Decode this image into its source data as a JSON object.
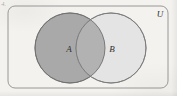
{
  "figure": {
    "kind": "venn-diagram",
    "corner_mark": "4.",
    "background_color": "#f4f2ef"
  },
  "universal_set": {
    "label": "U",
    "label_x": 160,
    "label_y": 17,
    "rect": {
      "x": 8,
      "y": 6,
      "width": 160,
      "height": 82,
      "corner_radius": 7
    },
    "stroke_color": "#8d8d8d",
    "stroke_width": 0.9,
    "fill_color": "none"
  },
  "sets": [
    {
      "label": "A",
      "cx": 70,
      "cy": 48,
      "r": 35,
      "fill_color": "#a9a9a9",
      "stroke_color": "#6f6f6f",
      "stroke_width": 0.9,
      "label_x": 69,
      "label_y": 52
    },
    {
      "label": "B",
      "cx": 111,
      "cy": 48,
      "r": 35,
      "fill_color": "#e4e4e4",
      "stroke_color": "#7a7a7a",
      "stroke_width": 0.9,
      "label_x": 112,
      "label_y": 52
    }
  ],
  "intersection": {
    "label": "",
    "fill_color": "#b2b2b2",
    "description": "A intersect B"
  },
  "label_font_size": 9
}
